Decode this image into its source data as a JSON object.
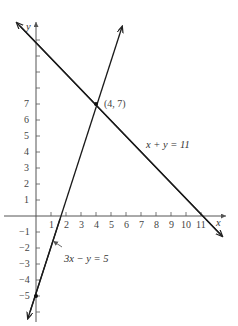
{
  "diagram": {
    "type": "coordinate-graph",
    "axes": {
      "x_label": "x",
      "y_label": "y",
      "x_ticks": [
        "1",
        "2",
        "3",
        "4",
        "5",
        "6",
        "7",
        "8",
        "9",
        "10",
        "11"
      ],
      "y_ticks_positive": [
        "1",
        "2",
        "3",
        "4",
        "5",
        "6",
        "7"
      ],
      "y_ticks_negative": [
        "−1",
        "−2",
        "−3",
        "−4",
        "−5"
      ]
    },
    "lines": [
      {
        "equation": "x + y = 11",
        "label": "x + y = 11"
      },
      {
        "equation": "3x − y = 5",
        "label": "3x − y = 5"
      }
    ],
    "intersection": {
      "label": "(4, 7)",
      "x": 4,
      "y": 7
    },
    "y_intercept_point": {
      "x": 0,
      "y": -5
    }
  }
}
